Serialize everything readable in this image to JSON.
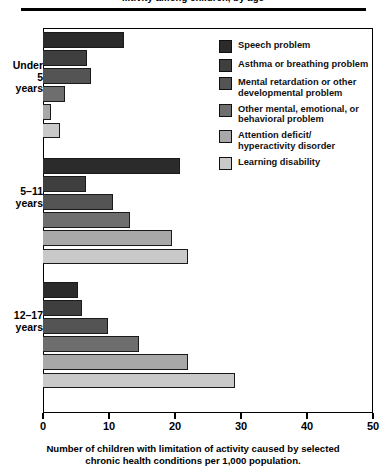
{
  "title": "...tivity among children, by age",
  "caption_line1": "Number of children with limitation of activity caused by selected",
  "caption_line2": "chronic health conditions per 1,000 population.",
  "legend": {
    "items": [
      {
        "label": "Speech problem",
        "color": "#2b2b2b"
      },
      {
        "label": "Asthma or breathing problem",
        "color": "#3f3f3f"
      },
      {
        "label": "Mental retardation or other\ndevelopmental problem",
        "color": "#545454"
      },
      {
        "label": "Other mental, emotional, or\nbehavioral problem",
        "color": "#6e6e6e"
      },
      {
        "label": "Attention deficit/\nhyperactivity disorder",
        "color": "#a8a8a8"
      },
      {
        "label": "Learning disability",
        "color": "#c9c9c9"
      }
    ]
  },
  "axis": {
    "ticks": [
      0,
      10,
      20,
      30,
      40,
      50
    ],
    "tick_labels": [
      "0",
      "10",
      "20",
      "30",
      "40",
      "50"
    ]
  },
  "groups": [
    {
      "label": "Under\n5\nyears"
    },
    {
      "label": "5–11\nyears"
    },
    {
      "label": "12–17\nyears"
    }
  ],
  "chart_data": {
    "type": "bar",
    "orientation": "horizontal",
    "title": "...tivity among children, by age",
    "xlabel": "Number of children with limitation of activity caused by selected chronic health conditions per 1,000 population.",
    "ylabel": "",
    "xlim": [
      0,
      50
    ],
    "xticks": [
      0,
      10,
      20,
      30,
      40,
      50
    ],
    "grid": false,
    "legend_position": "inside-right",
    "categories": [
      "Under 5 years",
      "5-11 years",
      "12-17 years"
    ],
    "series": [
      {
        "name": "Speech problem",
        "color": "#2b2b2b",
        "values": [
          12.3,
          20.7,
          5.3
        ]
      },
      {
        "name": "Asthma or breathing problem",
        "color": "#3f3f3f",
        "values": [
          6.6,
          6.5,
          5.9
        ]
      },
      {
        "name": "Mental retardation or other developmental problem",
        "color": "#545454",
        "values": [
          7.3,
          10.6,
          9.8
        ]
      },
      {
        "name": "Other mental, emotional, or behavioral problem",
        "color": "#6e6e6e",
        "values": [
          3.4,
          13.2,
          14.5
        ]
      },
      {
        "name": "Attention deficit/hyperactivity disorder",
        "color": "#a8a8a8",
        "values": [
          1.2,
          19.6,
          22.0
        ]
      },
      {
        "name": "Learning disability",
        "color": "#c9c9c9",
        "values": [
          2.6,
          21.9,
          29.1
        ]
      }
    ]
  }
}
